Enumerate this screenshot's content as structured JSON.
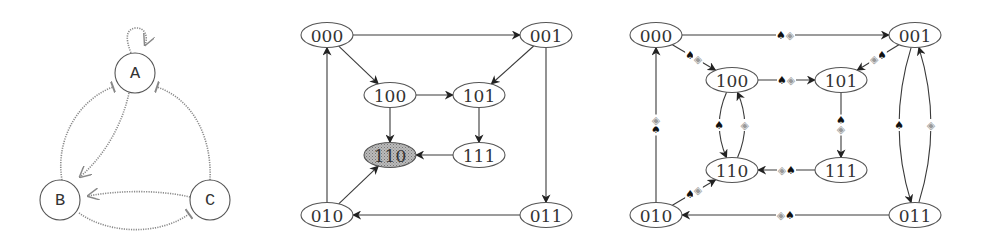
{
  "graphs": [
    {
      "id": "regulatory-network",
      "nodes": [
        {
          "id": "A",
          "label": "A"
        },
        {
          "id": "B",
          "label": "B"
        },
        {
          "id": "C",
          "label": "C"
        }
      ],
      "edges": [
        {
          "from": "A",
          "to": "A",
          "type": "activation"
        },
        {
          "from": "A",
          "to": "B",
          "type": "activation"
        },
        {
          "from": "B",
          "to": "A",
          "type": "inhibition"
        },
        {
          "from": "C",
          "to": "A",
          "type": "inhibition"
        },
        {
          "from": "C",
          "to": "B",
          "type": "activation"
        },
        {
          "from": "B",
          "to": "C",
          "type": "inhibition"
        }
      ]
    },
    {
      "id": "state-transition-graph",
      "highlighted_node": "110",
      "nodes": [
        {
          "id": "000",
          "label": "000"
        },
        {
          "id": "001",
          "label": "001"
        },
        {
          "id": "100",
          "label": "100"
        },
        {
          "id": "101",
          "label": "101"
        },
        {
          "id": "110",
          "label": "110"
        },
        {
          "id": "111",
          "label": "111"
        },
        {
          "id": "010",
          "label": "010"
        },
        {
          "id": "011",
          "label": "011"
        }
      ],
      "edges": [
        {
          "from": "000",
          "to": "001"
        },
        {
          "from": "000",
          "to": "100"
        },
        {
          "from": "001",
          "to": "101"
        },
        {
          "from": "001",
          "to": "011"
        },
        {
          "from": "100",
          "to": "101"
        },
        {
          "from": "100",
          "to": "110"
        },
        {
          "from": "101",
          "to": "111"
        },
        {
          "from": "111",
          "to": "110"
        },
        {
          "from": "010",
          "to": "000"
        },
        {
          "from": "010",
          "to": "110"
        },
        {
          "from": "011",
          "to": "010"
        }
      ]
    },
    {
      "id": "labeled-transition-graph",
      "label_symbols": {
        "spade": "♠",
        "diamond": "◈"
      },
      "nodes": [
        {
          "id": "000",
          "label": "000"
        },
        {
          "id": "001",
          "label": "001"
        },
        {
          "id": "100",
          "label": "100"
        },
        {
          "id": "101",
          "label": "101"
        },
        {
          "id": "110",
          "label": "110"
        },
        {
          "id": "111",
          "label": "111"
        },
        {
          "id": "010",
          "label": "010"
        },
        {
          "id": "011",
          "label": "011"
        }
      ],
      "edges": [
        {
          "from": "000",
          "to": "001",
          "labels": [
            "spade",
            "diamond"
          ]
        },
        {
          "from": "000",
          "to": "100",
          "labels": [
            "spade",
            "diamond"
          ]
        },
        {
          "from": "001",
          "to": "101",
          "labels": [
            "spade",
            "diamond"
          ]
        },
        {
          "from": "001",
          "to": "011",
          "labels": [
            "spade"
          ]
        },
        {
          "from": "011",
          "to": "001",
          "labels": [
            "diamond"
          ]
        },
        {
          "from": "100",
          "to": "101",
          "labels": [
            "spade",
            "diamond"
          ]
        },
        {
          "from": "100",
          "to": "110",
          "labels": [
            "spade"
          ]
        },
        {
          "from": "110",
          "to": "100",
          "labels": [
            "diamond"
          ]
        },
        {
          "from": "101",
          "to": "111",
          "labels": [
            "spade",
            "diamond"
          ]
        },
        {
          "from": "111",
          "to": "110",
          "labels": [
            "spade",
            "diamond"
          ]
        },
        {
          "from": "010",
          "to": "000",
          "labels": [
            "spade",
            "diamond"
          ]
        },
        {
          "from": "010",
          "to": "110",
          "labels": [
            "spade",
            "diamond"
          ]
        },
        {
          "from": "011",
          "to": "010",
          "labels": [
            "spade",
            "diamond"
          ]
        }
      ]
    }
  ]
}
